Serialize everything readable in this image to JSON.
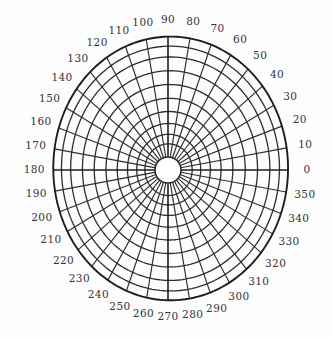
{
  "figure": {
    "name": "polar-grid",
    "background_color": "#fdfdfd",
    "line_color": "#2e2e2e",
    "label_color": "#33333a"
  },
  "chart_data": {
    "type": "scatter",
    "title": "",
    "subtitle": "",
    "xlabel": "",
    "ylabel": "",
    "grid": true,
    "legend": null,
    "projection": "polar",
    "angular_axis": {
      "unit": "degrees",
      "start": 0,
      "end": 360,
      "tick_step": 10,
      "direction": "counterclockwise",
      "zero_location": "east",
      "tick_labels": [
        "0",
        "10",
        "20",
        "30",
        "40",
        "50",
        "60",
        "70",
        "80",
        "90",
        "100",
        "110",
        "120",
        "130",
        "140",
        "150",
        "160",
        "170",
        "180",
        "190",
        "200",
        "210",
        "220",
        "230",
        "240",
        "250",
        "260",
        "270",
        "280",
        "290",
        "300",
        "310",
        "320",
        "330",
        "340",
        "350"
      ]
    },
    "radial_axis": {
      "ring_count": 9,
      "tick_labels": [],
      "inner_hole": true
    },
    "series": [],
    "values": [],
    "categories": []
  },
  "geometry": {
    "center_x": 168,
    "center_y": 170,
    "hole_radius": 13,
    "outer_radius_x": 121,
    "outer_radius_y": 128,
    "spoke_count": 36,
    "spoke_step_deg": 10,
    "ring_radii_fraction": [
      0.105,
      0.185,
      0.275,
      0.375,
      0.485,
      0.6,
      0.715,
      0.83,
      0.92,
      1.0
    ],
    "label_radius_pad": 19
  }
}
